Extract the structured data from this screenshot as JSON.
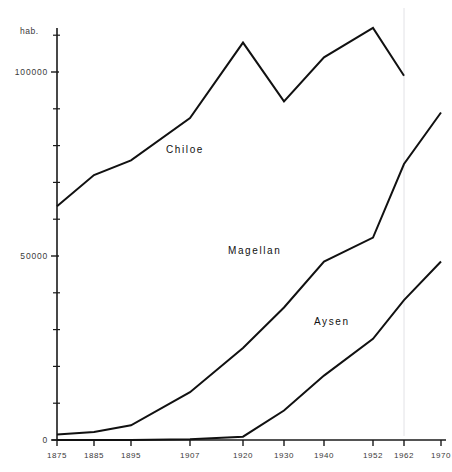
{
  "chart_data": {
    "type": "line",
    "title": "",
    "xlabel": "",
    "ylabel": "hab.",
    "unit_label": "hab.",
    "grid": false,
    "legend": "inline-annotations",
    "x": [
      1875,
      1885,
      1895,
      1907,
      1920,
      1930,
      1940,
      1952,
      1962,
      1970
    ],
    "categories": [
      "1875",
      "1885",
      "1895",
      "1907",
      "1920",
      "1930",
      "1940",
      "1952",
      "1962",
      "1970"
    ],
    "ylim": [
      0,
      120000
    ],
    "ytick_labels": [
      "0",
      "50000",
      "100000"
    ],
    "ytick_values": [
      0,
      50000,
      100000
    ],
    "yminor_step": 10000,
    "series": [
      {
        "name": "Chiloe",
        "color": "#111111",
        "x": [
          1875,
          1885,
          1895,
          1907,
          1920,
          1930,
          1940,
          1952,
          1962
        ],
        "values": [
          63500,
          72000,
          76000,
          87500,
          108000,
          92000,
          104000,
          112000,
          99000
        ]
      },
      {
        "name": "Magellan",
        "color": "#111111",
        "x": [
          1875,
          1885,
          1895,
          1907,
          1920,
          1930,
          1940,
          1952,
          1962,
          1970
        ],
        "values": [
          1500,
          2200,
          4000,
          13000,
          25000,
          36000,
          48500,
          55000,
          75000,
          89000
        ]
      },
      {
        "name": "Aysen",
        "color": "#111111",
        "x": [
          1875,
          1885,
          1895,
          1907,
          1920,
          1930,
          1940,
          1952,
          1962,
          1970
        ],
        "values": [
          0,
          0,
          0,
          200,
          900,
          8000,
          17500,
          27500,
          38000,
          48500
        ]
      }
    ],
    "annotations": [
      {
        "text": "Chiloe",
        "x_px": 166,
        "y_px": 153
      },
      {
        "text": "Magellan",
        "x_px": 228,
        "y_px": 254
      },
      {
        "text": "Aysen",
        "x_px": 314,
        "y_px": 325
      }
    ]
  },
  "axis": {
    "unit": "hab.",
    "y_labels": [
      "100000",
      "50000",
      "0"
    ],
    "x_labels": [
      "1875",
      "1885",
      "1895",
      "1907",
      "1920",
      "1930",
      "1940",
      "1952",
      "1962",
      "1970"
    ]
  },
  "series_labels": {
    "chiloe": "Chiloe",
    "magellan": "Magellan",
    "aysen": "Aysen"
  },
  "caption": {
    "text": ""
  },
  "colors": {
    "ink": "#111111",
    "axis": "#1a1a1a",
    "label": "#3a3a3a",
    "guide": "#e2e2e6",
    "background": "#ffffff"
  }
}
